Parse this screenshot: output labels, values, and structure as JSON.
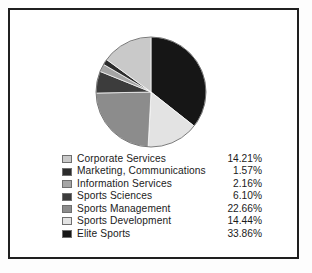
{
  "chart_data": {
    "type": "pie",
    "title": "",
    "subtitle": "",
    "xlabel": "",
    "ylabel": "",
    "legend_position": "below",
    "grid": false,
    "start_angle_deg": 0,
    "direction": "clockwise",
    "categories": [
      "Corporate Services",
      "Marketing, Communications",
      "Information Services",
      "Sports Sciences",
      "Sports Management",
      "Sports Development",
      "Elite Sports"
    ],
    "values": [
      14.21,
      1.57,
      2.16,
      6.1,
      22.66,
      14.44,
      33.86
    ],
    "value_labels": [
      "14.21%",
      "1.57%",
      "2.16%",
      "6.10%",
      "22.66%",
      "14.44%",
      "33.86%"
    ],
    "colors": [
      "#c9c9c9",
      "#2c2c2c",
      "#a5a5a5",
      "#3c3c3c",
      "#8c8c8c",
      "#e3e3e3",
      "#161616"
    ],
    "slice_order_from_12_oclock_clockwise": [
      "Elite Sports",
      "Sports Development",
      "Sports Management",
      "Sports Sciences",
      "Information Services",
      "Marketing, Communications",
      "Corporate Services"
    ]
  },
  "legend": {
    "rows": [
      {
        "label": "Corporate Services",
        "value": "14.21%",
        "color": "#c9c9c9"
      },
      {
        "label": "Marketing, Communications",
        "value": "1.57%",
        "color": "#2c2c2c"
      },
      {
        "label": "Information Services",
        "value": "2.16%",
        "color": "#a5a5a5"
      },
      {
        "label": "Sports Sciences",
        "value": "6.10%",
        "color": "#3c3c3c"
      },
      {
        "label": "Sports Management",
        "value": "22.66%",
        "color": "#8c8c8c"
      },
      {
        "label": "Sports Development",
        "value": "14.44%",
        "color": "#e3e3e3"
      },
      {
        "label": "Elite Sports",
        "value": "33.86%",
        "color": "#161616"
      }
    ]
  },
  "frame": {
    "border_color": "#1f1f1f",
    "background": "#ffffff"
  }
}
